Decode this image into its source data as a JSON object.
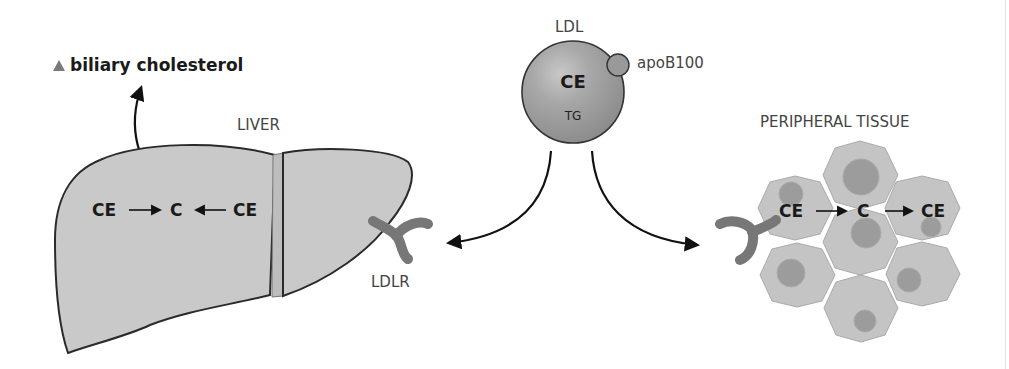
{
  "diagram": {
    "title_annotation": {
      "marker": "triangle-up-icon",
      "text": "biliary cholesterol"
    },
    "liver": {
      "label": "LIVER",
      "reaction": {
        "left": "CE",
        "center": "C",
        "right": "CE"
      }
    },
    "ldl": {
      "label": "LDL",
      "core_top": "CE",
      "core_bottom": "TG",
      "apoprotein": "apoB100"
    },
    "receptor": {
      "label": "LDLR"
    },
    "peripheral": {
      "label": "PERIPHERAL TISSUE",
      "reaction": {
        "left": "CE",
        "center": "C",
        "right": "CE"
      }
    },
    "colors": {
      "organ_fill": "#c9c9c9",
      "organ_stroke": "#2a2a2a",
      "ldl_fill": "#9a9a9a",
      "receptor_fill": "#777777",
      "cell_fill": "#c4c4c4",
      "nucleus_fill": "#9c9c9c",
      "text_dark": "#1a1a1a",
      "text_label": "#444444"
    }
  }
}
